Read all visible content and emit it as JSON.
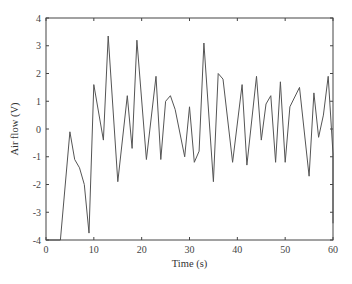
{
  "chart_data": {
    "type": "line",
    "title": "",
    "xlabel": "Time (s)",
    "ylabel": "Air flow (V)",
    "xlim": [
      0,
      60
    ],
    "ylim": [
      -4,
      4
    ],
    "xticks": [
      0,
      10,
      20,
      30,
      40,
      50,
      60
    ],
    "yticks": [
      -4,
      -3,
      -2,
      -1,
      0,
      1,
      2,
      3,
      4
    ],
    "grid": false,
    "legend": null,
    "line_color": "#555555",
    "series": [
      {
        "name": "Air flow",
        "x": [
          0,
          3,
          5,
          6,
          7,
          8,
          9,
          10,
          12,
          13,
          15,
          17,
          18,
          19,
          21,
          23,
          24,
          25,
          26,
          27,
          29,
          30,
          31,
          32,
          33,
          35,
          36,
          37,
          39,
          41,
          42,
          44,
          45,
          46,
          47,
          48,
          49,
          50,
          51,
          53,
          55,
          56,
          57,
          58,
          59,
          60,
          60
        ],
        "y": [
          -4.0,
          -4.0,
          -0.1,
          -1.1,
          -1.4,
          -2.0,
          -3.75,
          1.6,
          -0.4,
          3.35,
          -1.9,
          1.2,
          -0.7,
          3.2,
          -1.1,
          1.9,
          -1.1,
          1.0,
          1.2,
          0.7,
          -1.0,
          0.8,
          -1.2,
          -0.8,
          3.1,
          -1.9,
          2.0,
          1.8,
          -1.2,
          1.6,
          -1.3,
          1.9,
          -0.4,
          0.9,
          1.2,
          -1.2,
          1.7,
          -1.2,
          0.8,
          1.5,
          -1.7,
          1.3,
          -0.3,
          0.5,
          1.9,
          -0.9,
          -3.4
        ]
      }
    ]
  },
  "plot": {
    "left": 46,
    "right": 333,
    "top": 18,
    "bottom": 240
  },
  "caption": {
    "text": ""
  }
}
